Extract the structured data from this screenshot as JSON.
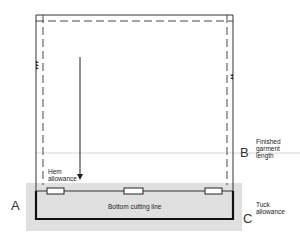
{
  "diagram": {
    "type": "garment hem layout",
    "labels": {
      "hem_allowance": [
        "Hem",
        "allowance"
      ],
      "bottom_cutting_line": "Bottom cutting line",
      "finished_garment_length": [
        "Finished",
        "garment",
        "length"
      ],
      "tuck_allowance": [
        "Tuck",
        "allowance"
      ]
    },
    "markers": {
      "a": "A",
      "b": "B",
      "c": "C"
    },
    "colors": {
      "line": "#1a1a1a",
      "band": "#e0e0e0",
      "guide": "#d8d8d8"
    }
  }
}
